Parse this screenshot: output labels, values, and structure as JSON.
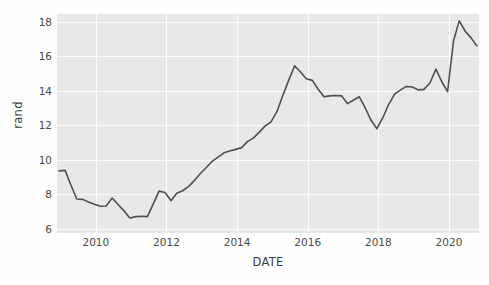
{
  "chart_data": {
    "type": "line",
    "title": "",
    "subtitle": "",
    "xlabel": "DATE",
    "ylabel": "rand",
    "xlim": [
      2008.9,
      2020.85
    ],
    "ylim": [
      5.75,
      18.45
    ],
    "grid": true,
    "legend": null,
    "legend_position": "none",
    "style": "seaborn-darkgrid",
    "line_color": "#4f4f4f",
    "plot_bg_color": "#e9e9e9",
    "grid_color": "#fdfdfd",
    "figure_bg_color": "#ffffff",
    "xticks": [
      2010,
      2012,
      2014,
      2016,
      2018,
      2020
    ],
    "xtick_labels": [
      "2010",
      "2012",
      "2014",
      "2016",
      "2018",
      "2020"
    ],
    "yticks": [
      6,
      8,
      10,
      12,
      14,
      16,
      18
    ],
    "ytick_labels": [
      "6",
      "8",
      "10",
      "12",
      "14",
      "16",
      "18"
    ],
    "series": [
      {
        "name": "rand",
        "x": [
          2008.96,
          2009.13,
          2009.29,
          2009.46,
          2009.63,
          2009.79,
          2009.96,
          2010.13,
          2010.29,
          2010.46,
          2010.63,
          2010.79,
          2010.96,
          2011.13,
          2011.29,
          2011.46,
          2011.63,
          2011.79,
          2011.96,
          2012.13,
          2012.29,
          2012.46,
          2012.63,
          2012.79,
          2012.96,
          2013.13,
          2013.29,
          2013.46,
          2013.63,
          2013.79,
          2013.96,
          2014.13,
          2014.29,
          2014.46,
          2014.63,
          2014.79,
          2014.96,
          2015.13,
          2015.29,
          2015.46,
          2015.63,
          2015.79,
          2015.96,
          2016.13,
          2016.29,
          2016.46,
          2016.63,
          2016.79,
          2016.96,
          2017.13,
          2017.29,
          2017.46,
          2017.63,
          2017.79,
          2017.96,
          2018.13,
          2018.29,
          2018.46,
          2018.63,
          2018.79,
          2018.96,
          2019.13,
          2019.29,
          2019.46,
          2019.63,
          2019.79,
          2019.96,
          2020.13,
          2020.29,
          2020.46,
          2020.63,
          2020.79
        ],
        "y": [
          9.35,
          9.38,
          8.55,
          7.72,
          7.7,
          7.55,
          7.42,
          7.3,
          7.32,
          7.78,
          7.4,
          7.05,
          6.62,
          6.7,
          6.72,
          6.7,
          7.45,
          8.18,
          8.1,
          7.62,
          8.05,
          8.2,
          8.45,
          8.8,
          9.2,
          9.55,
          9.9,
          10.15,
          10.4,
          10.5,
          10.6,
          10.7,
          11.05,
          11.25,
          11.6,
          11.95,
          12.2,
          12.8,
          13.7,
          14.6,
          15.45,
          15.1,
          14.7,
          14.6,
          14.1,
          13.65,
          13.7,
          13.72,
          13.7,
          13.25,
          13.45,
          13.65,
          13.0,
          12.3,
          11.8,
          12.45,
          13.2,
          13.8,
          14.05,
          14.25,
          14.22,
          14.05,
          14.08,
          14.45,
          15.25,
          14.55,
          13.95,
          16.9,
          18.05,
          17.45,
          17.05,
          16.6
        ]
      }
    ]
  },
  "axes": {
    "ylabel_text": "rand",
    "xlabel_text": "DATE"
  }
}
